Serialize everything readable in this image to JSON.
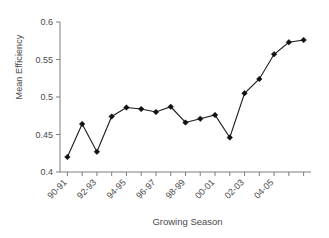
{
  "chart_data": {
    "type": "line",
    "title": "",
    "xlabel": "Growing Season",
    "ylabel": "Mean Efficiency",
    "ylim": [
      0.4,
      0.6
    ],
    "ytick_labels": [
      "0.4",
      "0.45",
      "0.5",
      "0.55",
      "0.6"
    ],
    "ytick_values": [
      0.4,
      0.45,
      0.5,
      0.55,
      0.6
    ],
    "grid": false,
    "legend": "none",
    "marker": "diamond",
    "line_color": "#111111",
    "marker_color": "#111111",
    "categories": [
      "90-91",
      "91-92",
      "92-93",
      "93-94",
      "94-95",
      "95-96",
      "96-97",
      "97-98",
      "98-99",
      "99-00",
      "00-01",
      "01-02",
      "02-03",
      "03-04",
      "04-05",
      "05-06",
      "06-07"
    ],
    "xtick_labels_shown": [
      "90-91",
      "92-93",
      "94-95",
      "96-97",
      "98-99",
      "00-01",
      "02-03",
      "04-05"
    ],
    "values": [
      0.42,
      0.464,
      0.427,
      0.474,
      0.486,
      0.484,
      0.48,
      0.487,
      0.466,
      0.471,
      0.476,
      0.446,
      0.505,
      0.524,
      0.557,
      0.573,
      0.576
    ],
    "series": [
      {
        "name": "Mean Efficiency",
        "values": [
          0.42,
          0.464,
          0.427,
          0.474,
          0.486,
          0.484,
          0.48,
          0.487,
          0.466,
          0.471,
          0.476,
          0.446,
          0.505,
          0.524,
          0.557,
          0.573,
          0.576
        ]
      }
    ]
  }
}
